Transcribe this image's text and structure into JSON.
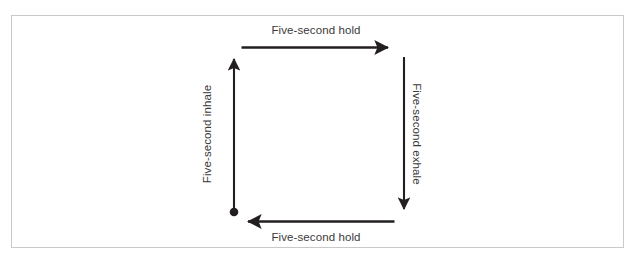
{
  "figure": {
    "kind": "box-breathing-cycle-diagram",
    "width": 636,
    "height": 267,
    "background_color": "#ffffff",
    "frame_color": "#c9c9c9",
    "stroke_color": "#231f20",
    "text_color": "#3a3a3a"
  },
  "steps": {
    "inhale": {
      "label": "Five-second inhale",
      "direction": "up",
      "side": "left",
      "rotation_deg": -90
    },
    "hold_top": {
      "label": "Five-second hold",
      "direction": "right",
      "side": "top",
      "rotation_deg": 0
    },
    "exhale": {
      "label": "Five-second exhale",
      "direction": "down",
      "side": "right",
      "rotation_deg": 90
    },
    "hold_bottom": {
      "label": "Five-second hold",
      "direction": "left",
      "side": "bottom",
      "rotation_deg": 0
    }
  },
  "start_marker": {
    "name": "start-dot",
    "x": 234,
    "y": 212,
    "radius": 4.2
  }
}
